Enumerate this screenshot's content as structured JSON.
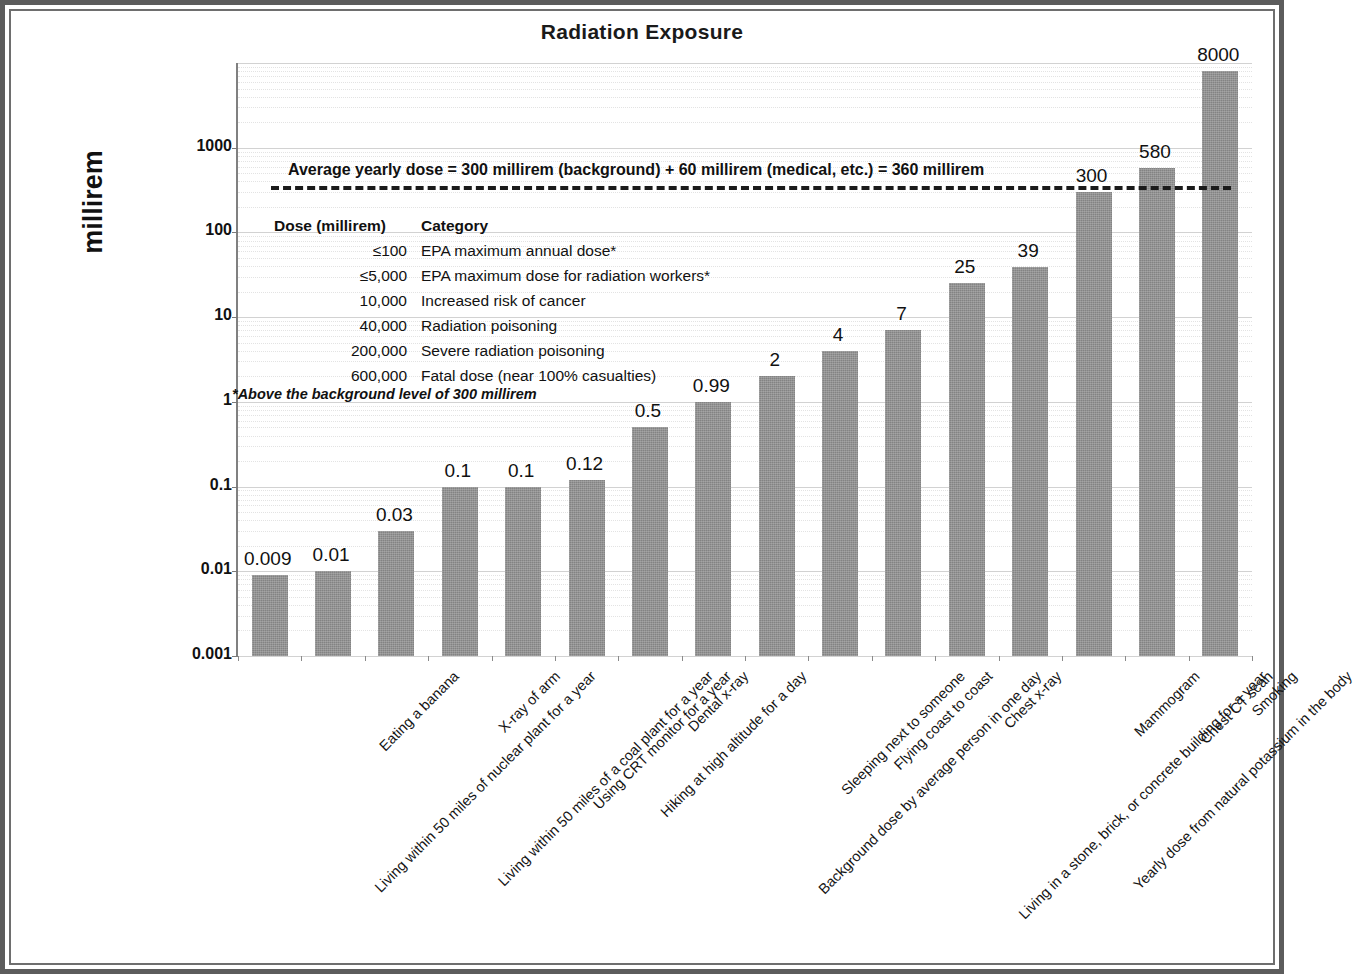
{
  "chart_data": {
    "type": "bar",
    "title": "Radiation Exposure",
    "xlabel": "",
    "ylabel": "millirem",
    "yscale": "log",
    "ylim": [
      0.001,
      10000
    ],
    "ytick_labels": [
      "0.001",
      "0.01",
      "0.1",
      "1",
      "10",
      "100",
      "1000"
    ],
    "ytick_values": [
      0.001,
      0.01,
      0.1,
      1,
      10,
      100,
      1000
    ],
    "grid": true,
    "legend": "none",
    "bar_color": "#838383",
    "categories": [
      "Living within 50 miles of nuclear plant for a year",
      "Eating a banana",
      "Living within 50 miles of a coal plant for a year",
      "X-ray of arm",
      "Using CRT monitor for a year",
      "Hiking at high altitude for a day",
      "Dental x-ray",
      "Background dose by average person in one day",
      "Sleeping next to someone",
      "Flying coast to coast",
      "Living in a stone, brick, or concrete building for a year",
      "Chest x-ray",
      "Yearly dose from natural potassium in the body",
      "Mammogram",
      "Chest CT scan",
      "Smoking"
    ],
    "values": [
      0.009,
      0.01,
      0.03,
      0.1,
      0.1,
      0.12,
      0.5,
      0.99,
      2,
      4,
      7,
      25,
      39,
      300,
      580,
      8000
    ],
    "value_labels": [
      "0.009",
      "0.01",
      "0.03",
      "0.1",
      "0.1",
      "0.12",
      "0.5",
      "0.99",
      "2",
      "4",
      "7",
      "25",
      "39",
      "300",
      "580",
      "8000"
    ],
    "annotations": {
      "average_line_value": 360,
      "average_line_text": "Average  yearly dose = 300 millirem (background) + 60 millirem (medical, etc.) = 360 millirem",
      "average_line_style": "dashed-black"
    }
  },
  "dose_table": {
    "headers": [
      "Dose (millirem)",
      "Category"
    ],
    "rows": [
      {
        "dose": "≤100",
        "category": "EPA maximum annual dose*"
      },
      {
        "dose": "≤5,000",
        "category": "EPA maximum dose for radiation workers*"
      },
      {
        "dose": "10,000",
        "category": "Increased risk of cancer"
      },
      {
        "dose": "40,000",
        "category": "Radiation poisoning"
      },
      {
        "dose": "200,000",
        "category": "Severe radiation poisoning"
      },
      {
        "dose": "600,000",
        "category": "Fatal dose (near 100% casualties)"
      }
    ],
    "footnote": "*Above the background level of 300 millirem"
  }
}
